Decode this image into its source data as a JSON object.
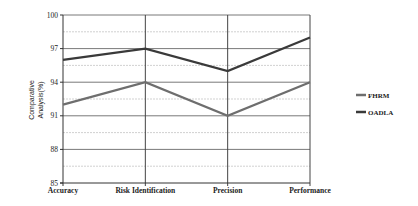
{
  "chart_data": {
    "type": "line",
    "title": "",
    "xlabel": "",
    "ylabel": "Comparative Analysis(%)",
    "ylabel_lines": [
      "Comparative",
      "Analysis(%)"
    ],
    "categories": [
      "Accuracy",
      "Risk Identification",
      "Precision",
      "Performance"
    ],
    "ylim": [
      85,
      100
    ],
    "yticks": [
      85,
      88,
      91,
      94,
      97,
      100
    ],
    "grid": true,
    "legend_position": "right",
    "series": [
      {
        "name": "FHRM",
        "color": "#6e6e6e",
        "values": [
          92,
          94,
          91,
          94
        ]
      },
      {
        "name": "OADLA",
        "color": "#3a3a3a",
        "values": [
          96,
          97,
          95,
          98
        ]
      }
    ]
  }
}
